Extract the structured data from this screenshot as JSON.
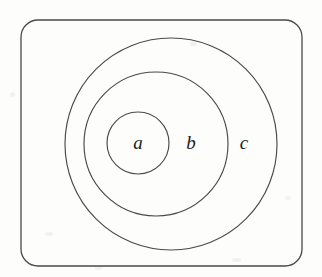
{
  "figure": {
    "background_color": "#fdfdfc",
    "stroke_color": "#4a4a4a",
    "label_color": "#1b1b1b",
    "universe": {
      "shape": "rounded-rectangle",
      "x": 21,
      "y": 20,
      "width": 281,
      "height": 246,
      "corner_radius": 17
    },
    "regions": [
      {
        "id": "c",
        "label": "c",
        "shape": "circle",
        "cx": 171,
        "cy": 144,
        "r": 106,
        "label_x": 244,
        "label_y": 145,
        "nesting_level": 1
      },
      {
        "id": "b",
        "label": "b",
        "shape": "circle",
        "cx": 156,
        "cy": 144,
        "r": 72,
        "label_x": 191,
        "label_y": 145,
        "nesting_level": 2
      },
      {
        "id": "a",
        "label": "a",
        "shape": "circle",
        "cx": 138,
        "cy": 143,
        "r": 31,
        "label_x": 138,
        "label_y": 145,
        "nesting_level": 3
      }
    ]
  }
}
